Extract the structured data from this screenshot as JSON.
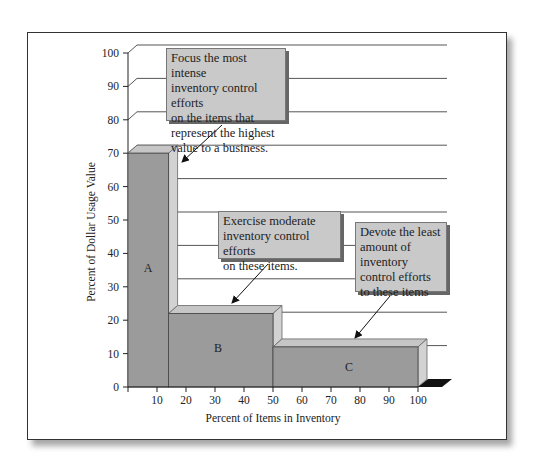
{
  "chart_data": {
    "type": "bar",
    "title": "",
    "xlabel": "Percent of Items in Inventory",
    "ylabel": "Percent of  Dollar Usage Value",
    "xlim": [
      0,
      100
    ],
    "ylim": [
      0,
      100
    ],
    "x_ticks": [
      10,
      20,
      30,
      40,
      50,
      60,
      70,
      80,
      90,
      100
    ],
    "y_ticks": [
      0,
      10,
      20,
      30,
      40,
      50,
      60,
      70,
      80,
      90,
      100
    ],
    "grid": true,
    "style": "3d-step",
    "categories": [
      "A",
      "B",
      "C"
    ],
    "x_ranges": [
      [
        0,
        14
      ],
      [
        14,
        50
      ],
      [
        50,
        100
      ]
    ],
    "values": [
      70,
      22,
      12
    ],
    "annotations": [
      {
        "text": "Focus the most intense inventory control efforts on the items that represent the highest value to a business.",
        "points_to": "A"
      },
      {
        "text": "Exercise moderate inventory control efforts on these items.",
        "points_to": "B"
      },
      {
        "text": "Devote the least amount of inventory control efforts to these items",
        "points_to": "C"
      }
    ]
  },
  "callouts": {
    "a": [
      "Focus the most intense",
      "inventory control efforts",
      "on the items that",
      "represent the highest",
      "value to a business."
    ],
    "b": [
      "Exercise moderate",
      "inventory control efforts",
      "on these items."
    ],
    "c": [
      "Devote the least",
      "amount of",
      "inventory",
      "control efforts",
      "to these items"
    ]
  },
  "colors": {
    "bar_face": "#9b9b9b",
    "bar_side": "#d2d2d2",
    "bar_top": "#c6c6c6",
    "callout_bg": "#c9c9c9",
    "grid": "#555555"
  }
}
